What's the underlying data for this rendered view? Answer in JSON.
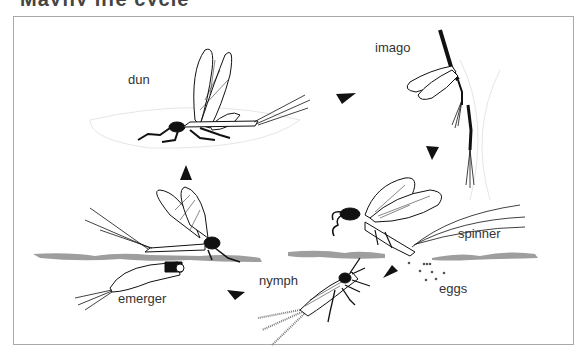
{
  "diagram": {
    "title_remnant": "Mayfly life cycle",
    "type": "life-cycle",
    "stages": [
      {
        "id": "dun",
        "label": "dun"
      },
      {
        "id": "imago",
        "label": "imago"
      },
      {
        "id": "spinner",
        "label": "spinner"
      },
      {
        "id": "eggs",
        "label": "eggs"
      },
      {
        "id": "nymph",
        "label": "nymph"
      },
      {
        "id": "emerger",
        "label": "emerger"
      }
    ],
    "cycle_order": [
      "dun",
      "imago",
      "spinner",
      "eggs",
      "nymph",
      "emerger",
      "dun"
    ],
    "colors": {
      "frame": "#aaaaaa",
      "water": "#9e9e9e",
      "ink": "#111111",
      "text": "#333333"
    }
  }
}
